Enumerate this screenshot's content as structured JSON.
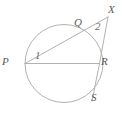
{
  "figure": {
    "name": "circle-secant-diagram",
    "background_color": "#ffffff",
    "stroke_color": "#b2b2b2",
    "label_color": "#5a5a5a"
  },
  "labels": {
    "P": "P",
    "Q": "Q",
    "R": "R",
    "S": "S",
    "X": "X",
    "angle_1": "1",
    "angle_2": "2"
  },
  "geometry": {
    "circle": {
      "cx": 64,
      "cy": 63.5,
      "r": 39
    },
    "points": {
      "P": {
        "x": 25,
        "y": 63.5
      },
      "Q": {
        "x": 82,
        "y": 31
      },
      "R": {
        "x": 99.5,
        "y": 63.5
      },
      "S": {
        "x": 92,
        "y": 100
      },
      "X": {
        "x": 108,
        "y": 17
      }
    },
    "segments": [
      {
        "name": "secant-P-Q-X",
        "from": "P",
        "to": "X"
      },
      {
        "name": "chord-P-R",
        "from": "P",
        "to": "R"
      },
      {
        "name": "secant-X-R-S",
        "from": "X",
        "to": "S"
      }
    ]
  }
}
